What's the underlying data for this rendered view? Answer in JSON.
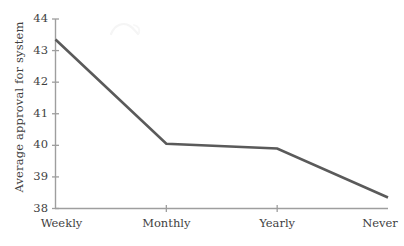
{
  "chart_data": {
    "type": "line",
    "title": "",
    "subtitle": "",
    "xlabel": "",
    "ylabel": "Average approval for system",
    "categories": [
      "Weekly",
      "Monthly",
      "Yearly",
      "Never"
    ],
    "values": [
      43.35,
      40.05,
      39.9,
      38.35
    ],
    "series": [
      {
        "name": "Average approval for system",
        "values": [
          43.35,
          40.05,
          39.9,
          38.35
        ]
      }
    ],
    "ylim": [
      38,
      44
    ],
    "y_ticks": [
      38,
      39,
      40,
      41,
      42,
      43,
      44
    ],
    "y_tick_labels": [
      "38",
      "39",
      "40",
      "41",
      "42",
      "43",
      "44"
    ],
    "x_ticks": [
      "Weekly",
      "Monthly",
      "Yearly",
      "Never"
    ],
    "grid": false,
    "legend": false,
    "legend_position": "none",
    "line_color": "#5a5a5a",
    "axis_color": "#9e9e9e",
    "text_color": "#3f3f3f",
    "background_color": "#ffffff",
    "line_width": 2.6,
    "markers": false
  },
  "axes": {
    "y_title": "Average approval for system",
    "y_tick_labels": [
      "44",
      "43",
      "42",
      "41",
      "40",
      "39",
      "38"
    ],
    "x_tick_labels": [
      "Weekly",
      "Monthly",
      "Yearly",
      "Never"
    ]
  },
  "figure": {
    "background_color": "#ffffff",
    "width": "404",
    "height": "246"
  }
}
